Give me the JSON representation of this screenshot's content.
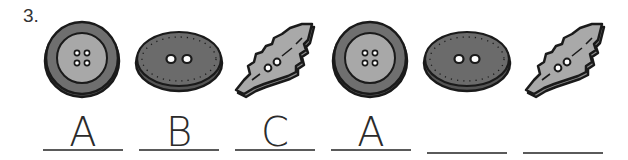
{
  "question": {
    "number": "3."
  },
  "pattern": [
    {
      "shape": "round-button",
      "label": "A"
    },
    {
      "shape": "oval-button",
      "label": "B"
    },
    {
      "shape": "leaf-button",
      "label": "C"
    },
    {
      "shape": "round-button",
      "label": "A"
    },
    {
      "shape": "oval-button",
      "label": ""
    },
    {
      "shape": "leaf-button",
      "label": ""
    }
  ],
  "colors": {
    "round_outer": "#6f6f6f",
    "round_inner": "#a8a8a8",
    "oval_fill": "#6b6b6b",
    "leaf_fill": "#a9a9a9",
    "outline": "#1a1a1a",
    "line": "#5a5a5a"
  }
}
